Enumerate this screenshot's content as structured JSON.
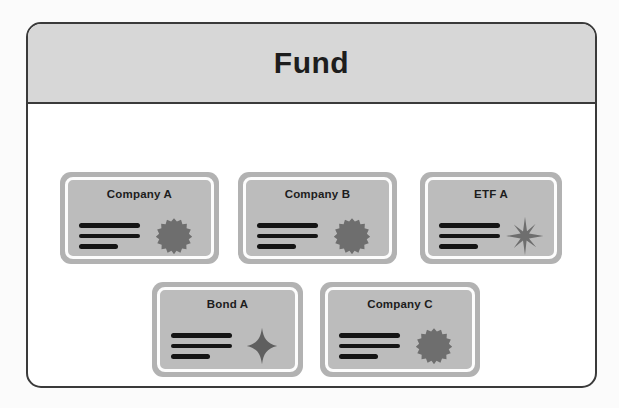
{
  "diagram": {
    "title": "Fund",
    "container": {
      "border_color": "#3a3a3a",
      "header_fill": "#d7d7d7",
      "body_fill": "#ffffff"
    },
    "card_style": {
      "frame_fill": "#b2b2b2",
      "inner_fill": "#bcbcbc",
      "ring_color": "#fdfdfd",
      "line_color": "#141414",
      "title_color": "#1d1d1d"
    },
    "holdings": [
      {
        "id": "company-a",
        "label": "Company A",
        "icon": "rosette-seal-icon",
        "row": 1,
        "column": 1,
        "lines": [
          "long",
          "long",
          "short"
        ]
      },
      {
        "id": "company-b",
        "label": "Company B",
        "icon": "rosette-seal-icon",
        "row": 1,
        "column": 2,
        "lines": [
          "long",
          "long",
          "short"
        ]
      },
      {
        "id": "etf-a",
        "label": "ETF A",
        "icon": "eight-point-sparkle-icon",
        "row": 1,
        "column": 3,
        "lines": [
          "long",
          "long",
          "short"
        ]
      },
      {
        "id": "bond-a",
        "label": "Bond A",
        "icon": "four-point-sparkle-icon",
        "row": 2,
        "column": 1,
        "lines": [
          "long",
          "long",
          "short"
        ]
      },
      {
        "id": "company-c",
        "label": "Company C",
        "icon": "rosette-seal-icon",
        "row": 2,
        "column": 2,
        "lines": [
          "long",
          "long",
          "short"
        ]
      }
    ]
  }
}
